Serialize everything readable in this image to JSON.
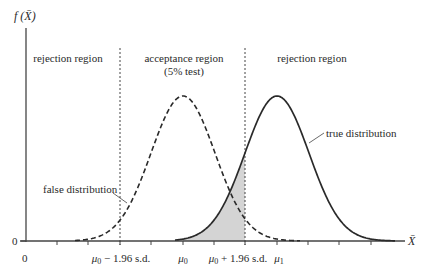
{
  "figure": {
    "y_axis_label": "f (X̄)",
    "x_axis_label": "X̄",
    "y_zero": "0",
    "x_zero": "0",
    "regions": {
      "left": "rejection region",
      "middle_line1": "acceptance region",
      "middle_line2": "(5% test)",
      "right": "rejection region"
    },
    "annotations": {
      "false_distribution": "false distribution",
      "true_distribution": "true distribution"
    },
    "tick_labels": {
      "lower_critical_mu": "μ",
      "lower_critical_sub": "0",
      "lower_critical_rest": " − 1.96 s.d.",
      "mu0_mu": "μ",
      "mu0_sub": "0",
      "upper_critical_mu": "μ",
      "upper_critical_sub": "0",
      "upper_critical_rest": " + 1.96 s.d.",
      "mu1_mu": "μ",
      "mu1_sub": "1"
    },
    "colors": {
      "curve": "#2a2a2a",
      "shade": "#d4d4d4",
      "axis": "#444444"
    }
  },
  "chart_data": {
    "type": "line",
    "title": "",
    "xlabel": "X̄",
    "ylabel": "f(X̄)",
    "series": [
      {
        "name": "false distribution",
        "style": "dashed",
        "mean_label": "μ0",
        "mean_px": 183,
        "sd_px": 32
      },
      {
        "name": "true distribution",
        "style": "solid",
        "mean_label": "μ1",
        "mean_px": 277,
        "sd_px": 32
      }
    ],
    "critical_values": [
      "μ0 − 1.96 s.d.",
      "μ0 + 1.96 s.d."
    ],
    "shaded_region": "area under true distribution between μ0 and μ0 + 1.96 s.d. (acceptance region)",
    "regions": [
      "rejection region",
      "acceptance region (5% test)",
      "rejection region"
    ],
    "grid": false,
    "legend": "none (inline annotations)"
  }
}
